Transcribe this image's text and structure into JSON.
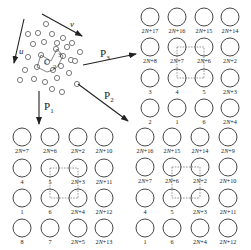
{
  "diagram": {
    "cluster": {
      "vector_labels": {
        "u": "u",
        "v": "v"
      },
      "numbered_atoms": [
        "1",
        "2",
        "3"
      ]
    },
    "arrows": [
      {
        "id": "P1",
        "label": "P",
        "subscript": "1"
      },
      {
        "id": "P2",
        "label": "P",
        "subscript": "2"
      },
      {
        "id": "P3",
        "label": "P",
        "subscript": "3"
      }
    ],
    "grids": [
      {
        "id": "grid-p3",
        "rows": [
          [
            "2N+17",
            "2N+16",
            "2N+15",
            "2N+14"
          ],
          [
            "2N+8",
            "2N+7",
            "2N+6",
            "2N+2"
          ],
          [
            "3",
            "4",
            "5",
            "2N+3"
          ],
          [
            "2",
            "1",
            "6",
            "2N+4"
          ]
        ]
      },
      {
        "id": "grid-p1",
        "rows": [
          [
            "2N+7",
            "2N+6",
            "2N+2",
            "2N+10"
          ],
          [
            "4",
            "5",
            "2N+3",
            "2N+11"
          ],
          [
            "1",
            "6",
            "2N+4",
            "2N+12"
          ],
          [
            "8",
            "7",
            "2N+5",
            "2N+13"
          ]
        ]
      },
      {
        "id": "grid-p2",
        "rows": [
          [
            "2N+16",
            "2N+15",
            "2N+14",
            "2N+9"
          ],
          [
            "2N+7",
            "2N+6",
            "2N+2",
            "2N+10"
          ],
          [
            "4",
            "5",
            "2N+3",
            "2N+11"
          ],
          [
            "1",
            "6",
            "2N+4",
            "2N+12"
          ]
        ]
      }
    ]
  }
}
